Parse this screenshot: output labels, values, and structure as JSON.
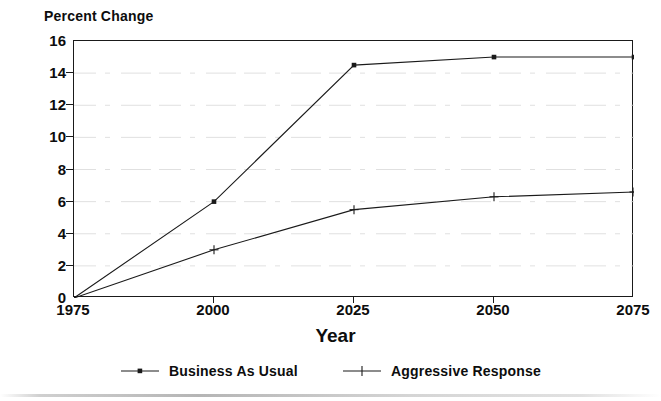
{
  "chart_data": {
    "type": "line",
    "title": "",
    "ylabel": "Percent Change",
    "xlabel": "Year",
    "x": [
      1975,
      2000,
      2025,
      2050,
      2075
    ],
    "xlim": [
      1975,
      2075
    ],
    "ylim": [
      0,
      16
    ],
    "yticks": [
      0,
      2,
      4,
      6,
      8,
      10,
      12,
      14,
      16
    ],
    "xticks": [
      1975,
      2000,
      2025,
      2050,
      2075
    ],
    "grid": "horizontal-faint",
    "legend_position": "bottom-center",
    "series": [
      {
        "name": "Business As Usual",
        "marker": "dot",
        "color": "#1a1a1a",
        "values": [
          0,
          6.0,
          14.5,
          15.0,
          15.0
        ]
      },
      {
        "name": "Aggressive Response",
        "marker": "plus",
        "color": "#1a1a1a",
        "values": [
          0,
          3.0,
          5.5,
          6.3,
          6.6
        ]
      }
    ]
  },
  "axes": {
    "y_tick_labels": [
      "16",
      "14",
      "12",
      "10",
      "8",
      "6",
      "4",
      "2",
      "0"
    ],
    "x_tick_labels": [
      "1975",
      "2000",
      "2025",
      "2050",
      "2075"
    ],
    "y_title": "Percent Change",
    "x_title": "Year"
  },
  "legend": {
    "items": [
      {
        "label": "Business As Usual",
        "marker": "dot-marker-icon"
      },
      {
        "label": "Aggressive Response",
        "marker": "plus-marker-icon"
      }
    ]
  }
}
